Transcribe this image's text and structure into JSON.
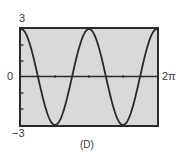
{
  "chart_data": {
    "type": "line",
    "title": "",
    "caption": "(D)",
    "function": "y = 3cos(2x)",
    "xlabel": "",
    "ylabel": "",
    "xlim": [
      0,
      6.2832
    ],
    "ylim": [
      -3,
      3
    ],
    "x_tick_labels": [
      "0",
      "2π"
    ],
    "y_tick_labels": [
      "3",
      "−3"
    ],
    "x_ticks": [
      1.5708,
      3.1416,
      4.7124
    ],
    "y_ticks": [
      -2,
      -1,
      1,
      2
    ],
    "grid": false,
    "legend": null,
    "series": [
      {
        "name": "3cos(2x)",
        "x": [
          0,
          0.3927,
          0.7854,
          1.1781,
          1.5708,
          1.9635,
          2.3562,
          2.7489,
          3.1416,
          3.5343,
          3.927,
          4.3197,
          4.7124,
          5.1051,
          5.4978,
          5.8905,
          6.2832
        ],
        "y": [
          3,
          2.12,
          0,
          -2.12,
          -3,
          -2.12,
          0,
          2.12,
          3,
          2.12,
          0,
          -2.12,
          -3,
          -2.12,
          0,
          2.12,
          3
        ]
      }
    ]
  },
  "labels": {
    "y_max": "3",
    "y_min": "−3",
    "x_min": "0",
    "x_max": "2π",
    "caption": "(D)"
  },
  "colors": {
    "plot_bg": "#d9d9d9",
    "frame": "#2a2a2a",
    "curve": "#2a2a2a",
    "axis": "#2a2a2a"
  }
}
